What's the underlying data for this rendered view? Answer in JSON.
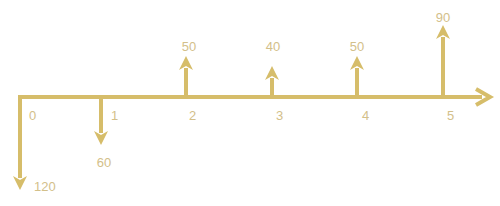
{
  "diagram": {
    "type": "cash-flow-diagram",
    "colors": {
      "line": "#d6bd6a",
      "label": "#d3c08a",
      "background": "#ffffff"
    },
    "axis": {
      "y": 97,
      "x_start": 20,
      "x_end": 490
    },
    "periods": [
      {
        "label": "0",
        "x": 20
      },
      {
        "label": "1",
        "x": 101
      },
      {
        "label": "2",
        "x": 186
      },
      {
        "label": "3",
        "x": 272
      },
      {
        "label": "4",
        "x": 357
      },
      {
        "label": "5",
        "x": 443
      }
    ],
    "cash_flows": [
      {
        "period": "0",
        "amount": "120",
        "direction": "down",
        "x": 20,
        "tip_y": 190
      },
      {
        "period": "1",
        "amount": "60",
        "direction": "down",
        "x": 101,
        "tip_y": 145
      },
      {
        "period": "2",
        "amount": "50",
        "direction": "up",
        "x": 186,
        "tip_y": 56
      },
      {
        "period": "3",
        "amount": "40",
        "direction": "up",
        "x": 272,
        "tip_y": 66
      },
      {
        "period": "4",
        "amount": "50",
        "direction": "up",
        "x": 357,
        "tip_y": 56
      },
      {
        "period": "5",
        "amount": "90",
        "direction": "up",
        "x": 443,
        "tip_y": 25
      }
    ]
  }
}
